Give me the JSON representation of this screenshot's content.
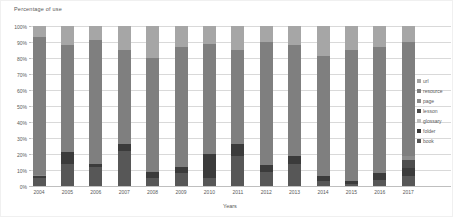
{
  "chart_data": {
    "type": "bar",
    "variant": "100%-stacked-column",
    "title": "Percentage of use",
    "xlabel": "Years",
    "ylabel": "Percentage of use",
    "ylim": [
      0,
      100
    ],
    "grid": true,
    "legend_position": "right",
    "yticks": [
      "0%",
      "10%",
      "20%",
      "30%",
      "40%",
      "50%",
      "60%",
      "70%",
      "80%",
      "90%",
      "100%"
    ],
    "categories": [
      "2004",
      "2005",
      "2006",
      "2007",
      "2008",
      "2009",
      "2010",
      "2011",
      "2012",
      "2013",
      "2014",
      "2015",
      "2016",
      "2017"
    ],
    "stack_order_bottom_to_top": [
      "book",
      "folder",
      "glossary",
      "lesson",
      "page",
      "resource",
      "url"
    ],
    "series": [
      {
        "name": "url",
        "color": "#a6a6a6",
        "values": [
          7,
          12,
          9,
          15,
          20,
          13,
          11,
          15,
          10,
          12,
          19,
          15,
          13,
          10
        ]
      },
      {
        "name": "resource",
        "color": "#7f7f7f",
        "values": [
          86,
          67,
          77,
          59,
          71,
          75,
          69,
          59,
          77,
          69,
          75,
          82,
          79,
          71
        ]
      },
      {
        "name": "page",
        "color": "#8c8c8c",
        "values": [
          1,
          0,
          0,
          0,
          0,
          0,
          0,
          0,
          0,
          0,
          0,
          0,
          0,
          3
        ]
      },
      {
        "name": "lesson",
        "color": "#4d4d4d",
        "values": [
          0,
          0,
          0,
          0,
          0,
          0,
          0,
          0,
          0,
          0,
          0,
          0,
          0,
          5
        ]
      },
      {
        "name": "glossary",
        "color": "#bfbfbf",
        "values": [
          0,
          0,
          0,
          0,
          0,
          0,
          0,
          0,
          0,
          0,
          0,
          0,
          0,
          0
        ]
      },
      {
        "name": "folder",
        "color": "#3b3b3b",
        "values": [
          1,
          7,
          2,
          4,
          4,
          4,
          15,
          7,
          4,
          5,
          3,
          2,
          4,
          5
        ]
      },
      {
        "name": "book",
        "color": "#575757",
        "values": [
          5,
          14,
          12,
          22,
          5,
          8,
          5,
          19,
          9,
          14,
          3,
          1,
          4,
          6
        ]
      }
    ]
  }
}
